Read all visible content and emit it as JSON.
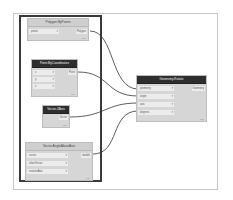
{
  "canvas": {
    "frame_color": "#c8c8c8",
    "group_border_color": "#3a3a3a",
    "wire_color": "#333333"
  },
  "nodes": {
    "polygon_by_points": {
      "title": "Polygon.ByPoints",
      "inputs": [
        {
          "label": "points",
          "arrow": ">"
        }
      ],
      "output": "Polygon",
      "lacing": "auto"
    },
    "point_by_coordinates": {
      "title": "Point.ByCoordinates",
      "inputs": [
        {
          "label": "x",
          "arrow": ">"
        },
        {
          "label": "y",
          "arrow": ">"
        },
        {
          "label": "z",
          "arrow": ">"
        }
      ],
      "output": "Point",
      "lacing": "auto"
    },
    "vector_zaxis": {
      "title": "Vector.ZAxis",
      "inputs": [],
      "output": "Vector",
      "lacing": "auto"
    },
    "vector_angle_about_axis": {
      "title": "Vector.AngleAboutAxis",
      "inputs": [
        {
          "label": "vector",
          "arrow": ">"
        },
        {
          "label": "otherVector",
          "arrow": ">"
        },
        {
          "label": "rotationAxis",
          "arrow": ">"
        }
      ],
      "output": "double",
      "lacing": "auto"
    },
    "geometry_rotate": {
      "title": "Geometry.Rotate",
      "inputs": [
        {
          "label": "geometry",
          "arrow": ">"
        },
        {
          "label": "origin",
          "arrow": ">"
        },
        {
          "label": "axis",
          "arrow": ">"
        },
        {
          "label": "degrees",
          "arrow": ">"
        }
      ],
      "output": "Geometry",
      "lacing": "auto"
    }
  },
  "connections": [
    {
      "from": "Polygon.ByPoints.Polygon",
      "to": "Geometry.Rotate.geometry"
    },
    {
      "from": "Point.ByCoordinates.Point",
      "to": "Geometry.Rotate.origin"
    },
    {
      "from": "Vector.ZAxis.Vector",
      "to": "Geometry.Rotate.axis"
    },
    {
      "from": "Vector.AngleAboutAxis.double",
      "to": "Geometry.Rotate.degrees"
    }
  ]
}
